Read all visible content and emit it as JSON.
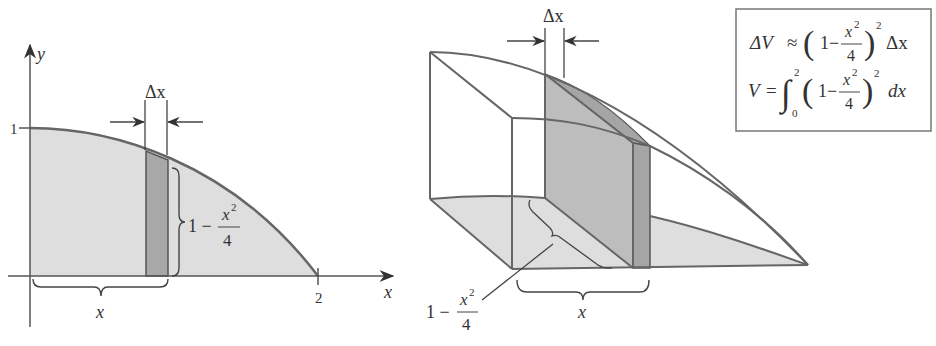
{
  "figure": {
    "left_panel": {
      "y_axis_label": "y",
      "x_axis_label": "x",
      "y_tick": "1",
      "x_tick": "2",
      "strip_width_label": "Δx",
      "height_label": {
        "lead": "1 −",
        "num": "x",
        "sup": "2",
        "den": "4"
      },
      "position_label": "x",
      "curve": "y = 1 - x^2/4, 0 ≤ x ≤ 2"
    },
    "right_panel": {
      "slab_width_label": "Δx",
      "side_label": {
        "lead": "1 −",
        "num": "x",
        "sup": "2",
        "den": "4"
      },
      "position_label": "x"
    },
    "formulas": {
      "line1": {
        "lhs": "ΔV",
        "rel": "≈",
        "open": "(",
        "one": "1−",
        "num": "x",
        "sup": "2",
        "den": "4",
        "close": ")",
        "power": "2",
        "tail": "Δx"
      },
      "line2": {
        "lhs": "V",
        "rel": "=",
        "int": "∫",
        "upper": "2",
        "lower": "0",
        "open": "(",
        "one": "1−",
        "num": "x",
        "sup": "2",
        "den": "4",
        "close": ")",
        "power": "2",
        "tail": "dx"
      }
    },
    "colors": {
      "region_fill": "#dedede",
      "strip_fill": "#a8a8a8",
      "slab_fill": "#bdbdbd",
      "outline": "#666666"
    }
  }
}
